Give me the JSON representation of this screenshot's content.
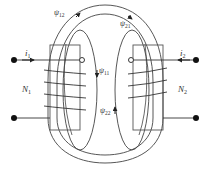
{
  "diagram": {
    "colors": {
      "stroke": "#333333",
      "background": "#ffffff"
    },
    "labels": {
      "i1": {
        "base": "i",
        "sub": "1"
      },
      "i2": {
        "base": "i",
        "sub": "2"
      },
      "n1": {
        "base": "N",
        "sub": "1"
      },
      "n2": {
        "base": "N",
        "sub": "2"
      },
      "psi12": {
        "base": "ψ",
        "sub": "12"
      },
      "psi21": {
        "base": "ψ",
        "sub": "21"
      },
      "psi11": {
        "base": "ψ",
        "sub": "11"
      },
      "psi22": {
        "base": "ψ",
        "sub": "22"
      }
    },
    "components": {
      "coil_left": {
        "name": "N1",
        "turns_visible": 4
      },
      "coil_right": {
        "name": "N2",
        "turns_visible": 4
      },
      "terminals": [
        "left-top",
        "left-bottom",
        "right-top",
        "right-bottom"
      ],
      "dot_markers": [
        "left-coil-open-circle",
        "right-coil-open-circle"
      ]
    }
  }
}
